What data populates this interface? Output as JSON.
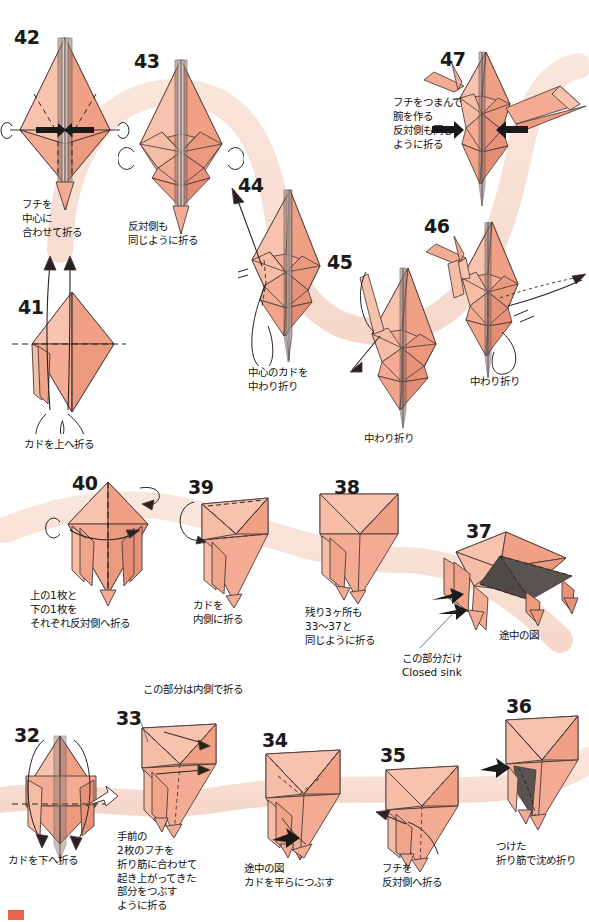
{
  "page": {
    "language": "ja",
    "paper_color": "#f2a68c",
    "paper_light": "#f7c3ae",
    "paper_dark": "#e8906f",
    "shadow_color": "#5a5050",
    "ribbon_color": "#f7ded4",
    "line_color": "#4a3a38",
    "text_color": "#111111",
    "corner_mark_color": "#e8654a"
  },
  "steps": [
    {
      "number": "42",
      "caption": "フチを\n中心に\n合わせて折る",
      "num_pos": {
        "x": 14,
        "y": 28
      },
      "cap_pos": {
        "x": 22,
        "y": 198
      }
    },
    {
      "number": "43",
      "caption": "反対側も\n同じように折る",
      "num_pos": {
        "x": 134,
        "y": 52
      },
      "cap_pos": {
        "x": 128,
        "y": 220
      }
    },
    {
      "number": "47",
      "caption": "フチをつまんで\n腕を作る\n反対側も同じ\nように折る",
      "num_pos": {
        "x": 440,
        "y": 50
      },
      "cap_pos": {
        "x": 393,
        "y": 96
      }
    },
    {
      "number": "44",
      "caption": "中心のカドを\n中わり折り",
      "num_pos": {
        "x": 238,
        "y": 176
      },
      "cap_pos": {
        "x": 248,
        "y": 366
      }
    },
    {
      "number": "45",
      "caption": "中わり折り",
      "num_pos": {
        "x": 327,
        "y": 253
      },
      "cap_pos": {
        "x": 364,
        "y": 432
      }
    },
    {
      "number": "46",
      "caption": "中わり折り",
      "num_pos": {
        "x": 424,
        "y": 217
      },
      "cap_pos": {
        "x": 470,
        "y": 375
      }
    },
    {
      "number": "41",
      "caption": "カドを上へ折る",
      "num_pos": {
        "x": 18,
        "y": 298
      },
      "cap_pos": {
        "x": 24,
        "y": 438
      }
    },
    {
      "number": "40",
      "caption": "上の1枚と\n下の1枚を\nそれぞれ反対側へ折る",
      "num_pos": {
        "x": 72,
        "y": 474
      },
      "cap_pos": {
        "x": 30,
        "y": 589
      }
    },
    {
      "number": "39",
      "caption": "カドを\n内側に折る",
      "num_pos": {
        "x": 188,
        "y": 478
      },
      "cap_pos": {
        "x": 193,
        "y": 599
      }
    },
    {
      "number": "38",
      "caption": "残り3ヶ所も\n33〜37と\n同じように折る",
      "num_pos": {
        "x": 334,
        "y": 478
      },
      "cap_pos": {
        "x": 305,
        "y": 606
      }
    },
    {
      "number": "37",
      "caption": "この部分だけ\nClosed sink",
      "caption2": "途中の図",
      "num_pos": {
        "x": 466,
        "y": 522
      },
      "cap_pos": {
        "x": 402,
        "y": 652
      },
      "cap2_pos": {
        "x": 499,
        "y": 629
      }
    },
    {
      "number": "32",
      "caption": "カドを下へ折る",
      "num_pos": {
        "x": 14,
        "y": 726
      },
      "cap_pos": {
        "x": 8,
        "y": 854
      }
    },
    {
      "number": "33",
      "caption": "手前の\n2枚のフチを\n折り筋に合わせて\n起き上がってきた\n部分をつぶす\nように折る",
      "caption_top": "この部分は内側で折る",
      "num_pos": {
        "x": 116,
        "y": 709
      },
      "cap_pos": {
        "x": 117,
        "y": 830
      },
      "cap_top_pos": {
        "x": 143,
        "y": 683
      }
    },
    {
      "number": "34",
      "caption": "途中の図\nカドを平らにつぶす",
      "num_pos": {
        "x": 262,
        "y": 731
      },
      "cap_pos": {
        "x": 244,
        "y": 862
      }
    },
    {
      "number": "35",
      "caption": "フチを\n反対側へ折る",
      "num_pos": {
        "x": 380,
        "y": 746
      },
      "cap_pos": {
        "x": 382,
        "y": 862
      }
    },
    {
      "number": "36",
      "caption": "つけた\n折り筋で沈め折り",
      "num_pos": {
        "x": 506,
        "y": 697
      },
      "cap_pos": {
        "x": 496,
        "y": 840
      }
    }
  ]
}
